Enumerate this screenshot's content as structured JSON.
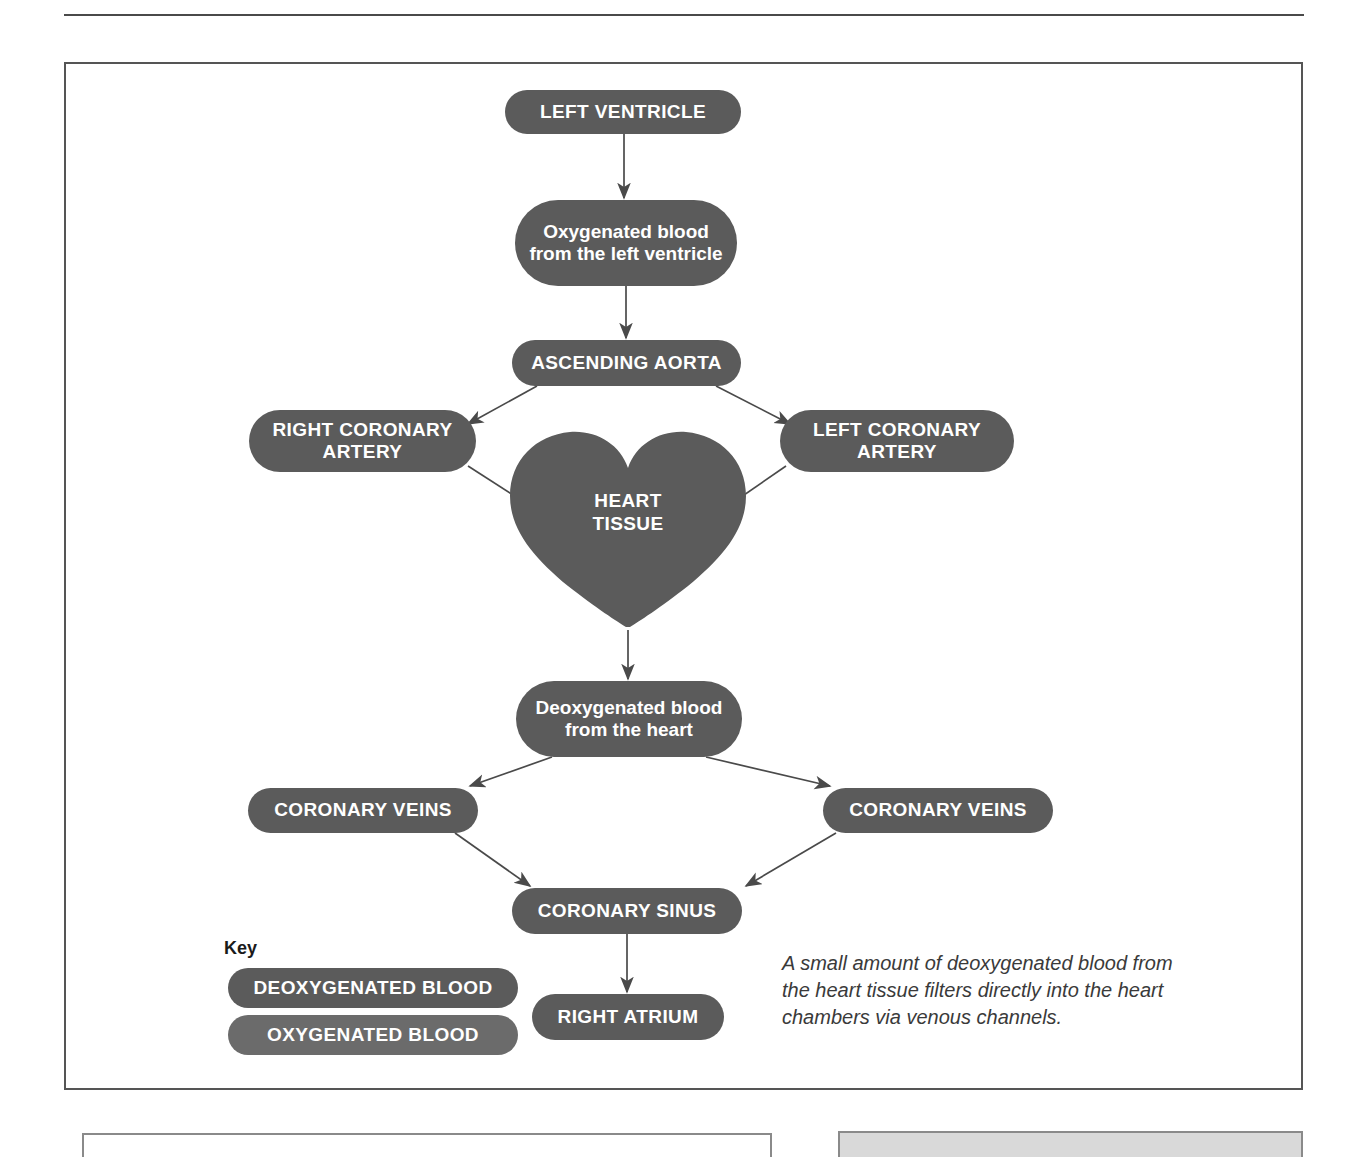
{
  "figure": {
    "colors": {
      "node_fill": "#5b5b5b",
      "node_text": "#ffffff",
      "key_oxygenated_fill": "#6b6b6b",
      "key_deoxygenated_fill": "#5b5b5b",
      "frame_border": "#555555",
      "connector": "#4a4a4a"
    },
    "nodes": [
      {
        "id": "left-ventricle",
        "label": "LEFT VENTRICLE"
      },
      {
        "id": "oxygenated-blood",
        "label": "Oxygenated blood\nfrom the left ventricle",
        "line1": "Oxygenated blood",
        "line2": "from the left ventricle"
      },
      {
        "id": "ascending-aorta",
        "label": "ASCENDING AORTA"
      },
      {
        "id": "right-coronary-artery",
        "label": "RIGHT CORONARY ARTERY",
        "line1": "RIGHT CORONARY",
        "line2": "ARTERY"
      },
      {
        "id": "left-coronary-artery",
        "label": "LEFT CORONARY ARTERY",
        "line1": "LEFT CORONARY",
        "line2": "ARTERY"
      },
      {
        "id": "heart-tissue",
        "label": "HEART TISSUE",
        "line1": "HEART",
        "line2": "TISSUE"
      },
      {
        "id": "deoxygenated-blood",
        "label": "Deoxygenated blood from the heart",
        "line1": "Deoxygenated blood",
        "line2": "from the heart"
      },
      {
        "id": "coronary-veins-left",
        "label": "CORONARY VEINS"
      },
      {
        "id": "coronary-veins-right",
        "label": "CORONARY VEINS"
      },
      {
        "id": "coronary-sinus",
        "label": "CORONARY SINUS"
      },
      {
        "id": "right-atrium",
        "label": "RIGHT ATRIUM"
      }
    ],
    "key": {
      "title": "Key",
      "items": [
        {
          "id": "deoxygenated",
          "label": "DEOXYGENATED BLOOD"
        },
        {
          "id": "oxygenated",
          "label": "OXYGENATED BLOOD"
        }
      ]
    },
    "caption": "A small amount of deoxygenated blood from the heart tissue filters directly into the heart chambers via venous channels.",
    "flow": [
      "LEFT VENTRICLE -> Oxygenated blood from the left ventricle",
      "Oxygenated blood from the left ventricle -> ASCENDING AORTA",
      "ASCENDING AORTA -> RIGHT CORONARY ARTERY",
      "ASCENDING AORTA -> LEFT CORONARY ARTERY",
      "RIGHT CORONARY ARTERY -> HEART TISSUE",
      "LEFT CORONARY ARTERY -> HEART TISSUE",
      "HEART TISSUE -> Deoxygenated blood from the heart",
      "Deoxygenated blood from the heart -> CORONARY VEINS (left)",
      "Deoxygenated blood from the heart -> CORONARY VEINS (right)",
      "CORONARY VEINS (left) -> CORONARY SINUS",
      "CORONARY VEINS (right) -> CORONARY SINUS",
      "CORONARY SINUS -> RIGHT ATRIUM"
    ]
  }
}
